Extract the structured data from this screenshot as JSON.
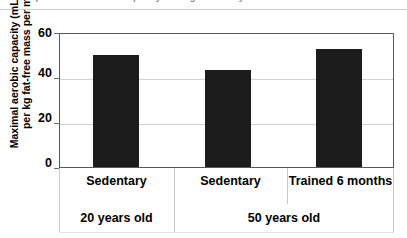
{
  "caption": {
    "partial_text": "Comparison of aerobic capacity among sedentary and trained individuals"
  },
  "chart_data": {
    "type": "bar",
    "title": "",
    "xlabel": "",
    "ylabel": "Maximal aerobic capacity (mL O2/Kg per kg fat-free mass per min)",
    "categories": [
      "Sedentary",
      "Sedentary",
      "Trained 6 months"
    ],
    "groups": [
      {
        "label": "20 years old",
        "span": 1
      },
      {
        "label": "50 years old",
        "span": 2
      }
    ],
    "values": [
      50,
      43,
      52.5
    ],
    "ylim": [
      0,
      60
    ],
    "yticks": [
      0,
      20,
      40,
      60
    ],
    "ytick_labels": [
      "0",
      "20",
      "40",
      "60"
    ],
    "gridlines": [
      20,
      40
    ],
    "grid": true,
    "legend": null,
    "bar_color": "#1c1c1c",
    "frame_color": "#58585a",
    "grid_color": "#d2d2d2",
    "background": "#ffffff"
  }
}
